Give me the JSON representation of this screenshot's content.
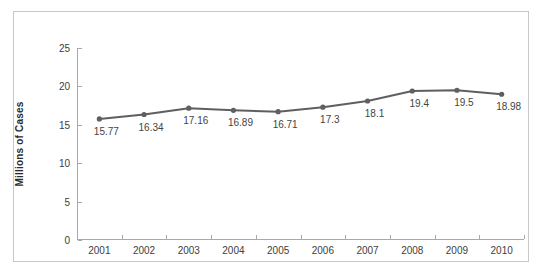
{
  "chart_data": {
    "type": "line",
    "title": "",
    "xlabel": "",
    "ylabel": "Millions of Cases",
    "categories": [
      "2001",
      "2002",
      "2003",
      "2004",
      "2005",
      "2006",
      "2007",
      "2008",
      "2009",
      "2010"
    ],
    "values": [
      15.77,
      16.34,
      17.16,
      16.89,
      16.71,
      17.3,
      18.1,
      19.4,
      19.5,
      18.98
    ],
    "point_labels": [
      "15.77",
      "16.34",
      "17.16",
      "16.89",
      "16.71",
      "17.3",
      "18.1",
      "19.4",
      "19.5",
      "18.98"
    ],
    "ylim": [
      0,
      25
    ],
    "y_ticks": [
      0,
      5,
      10,
      15,
      20,
      25
    ],
    "y_tick_labels": [
      "0",
      "5",
      "10",
      "15",
      "20",
      "25"
    ],
    "grid": false,
    "legend": "none",
    "series": [
      {
        "name": "Millions of Cases",
        "color": "#5f5f5f",
        "marker": "circle",
        "values": [
          15.77,
          16.34,
          17.16,
          16.89,
          16.71,
          17.3,
          18.1,
          19.4,
          19.5,
          18.98
        ]
      }
    ]
  },
  "style": {
    "line_color": "#5f5f5f",
    "marker_color": "#5f5f5f",
    "axis_color": "#a9a9a9",
    "label_color": "#404040",
    "border_color": "#c8c8c8",
    "background": "#ffffff"
  }
}
